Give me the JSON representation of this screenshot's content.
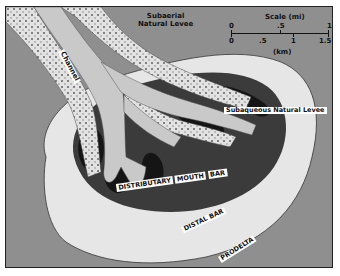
{
  "diagram": {
    "labels": {
      "channel": "Channel",
      "subaerial_levee_line1": "Subaerial",
      "subaerial_levee_line2": "Natural Levee",
      "subaqueous_levee": "Subaqueous Natural Levee",
      "mouth_bar_1": "DISTRIBUTARY",
      "mouth_bar_2": "MOUTH",
      "mouth_bar_3": "BAR",
      "distal_bar": "DISTAL BAR",
      "prodelta": "PRODELTA"
    },
    "scale": {
      "title": "Scale (mi)",
      "mi_ticks": [
        "0",
        ".5",
        "1"
      ],
      "km_ticks": [
        "0",
        ".5",
        "1",
        "1.5"
      ],
      "km_label": "(km)"
    },
    "colors": {
      "mouth_bar": "#3a3a3a",
      "subaqueous_levee": "#1a1a1a",
      "distal_bar": "#e4e4e4",
      "prodelta": "#cfcfcf",
      "channel": "#c8c8c8",
      "levee": "#dedede"
    }
  }
}
